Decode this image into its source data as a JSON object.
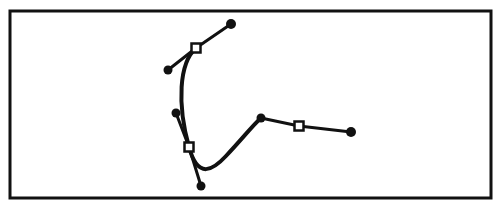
{
  "canvas": {
    "width": 502,
    "height": 209,
    "background_color": "#ffffff",
    "stroke_color": "#111111",
    "handle_line_color": "#111111",
    "anchor_fill_color": "#ffffff",
    "anchor_stroke_color": "#111111",
    "handle_point_color": "#111111"
  },
  "frame": {
    "name": "artboard-frame",
    "x": 10,
    "y": 11,
    "width": 481,
    "height": 187,
    "stroke_width": 3
  },
  "path": {
    "name": "bezier-path",
    "stroke_width": 4,
    "closed": false,
    "d": "M 196 48 C 179 63 177 104 189 147 C 198 180 213 170 226 156 C 244 137 252 126 261 118",
    "segments": [
      {
        "from": "anchor-1",
        "to": "anchor-2",
        "c1_x": 179,
        "c1_y": 63,
        "c2_x": 177,
        "c2_y": 104
      },
      {
        "from": "anchor-2",
        "to": "anchor-3",
        "c1_x": 210,
        "c1_y": 178,
        "c2_x": 240,
        "c2_y": 140
      }
    ]
  },
  "anchors": [
    {
      "name": "anchor-point-1",
      "label": "Anchor 1",
      "x": 196,
      "y": 48,
      "size": 9,
      "selected": true,
      "handles": [
        {
          "name": "handle-in-1",
          "label": "Handle In 1",
          "x": 168,
          "y": 70,
          "radius": 4.5
        },
        {
          "name": "handle-out-1",
          "label": "Handle Out 1",
          "x": 231,
          "y": 24,
          "radius": 5
        }
      ]
    },
    {
      "name": "anchor-point-2",
      "label": "Anchor 2",
      "x": 189,
      "y": 147,
      "size": 9,
      "selected": true,
      "handles": [
        {
          "name": "handle-in-2",
          "label": "Handle In 2",
          "x": 176,
          "y": 113,
          "radius": 4.5
        },
        {
          "name": "handle-out-2",
          "label": "Handle Out 2",
          "x": 201,
          "y": 186,
          "radius": 4.5
        }
      ]
    },
    {
      "name": "anchor-point-3",
      "label": "Anchor 3",
      "x": 299,
      "y": 126,
      "size": 9,
      "selected": true,
      "handles": [
        {
          "name": "handle-in-3",
          "label": "Handle In 3",
          "x": 261,
          "y": 118,
          "radius": 4.5
        },
        {
          "name": "handle-out-3",
          "label": "Handle Out 3",
          "x": 351,
          "y": 132,
          "radius": 5
        }
      ]
    }
  ]
}
